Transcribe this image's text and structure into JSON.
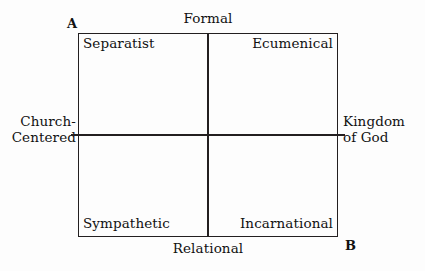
{
  "diagram": {
    "type": "two-by-two-quadrant-matrix",
    "title": "",
    "axes": {
      "horizontal": {
        "left_label": "Church-\nCentered",
        "left_label_lines": [
          "Church-",
          "Centered"
        ],
        "right_label": "Kingdom\nof God",
        "right_label_lines": [
          "Kingdom",
          "of God"
        ]
      },
      "vertical": {
        "top_label": "Formal",
        "bottom_label": "Relational"
      }
    },
    "corner_markers": [
      {
        "id": "marker-a",
        "label": "A",
        "position": "top-left"
      },
      {
        "id": "marker-b",
        "label": "B",
        "position": "bottom-right"
      }
    ],
    "quadrants": [
      {
        "id": "top-left",
        "label": "Separatist",
        "horizontal_axis_value": "Church-Centered",
        "vertical_axis_value": "Formal"
      },
      {
        "id": "top-right",
        "label": "Ecumenical",
        "horizontal_axis_value": "Kingdom of God",
        "vertical_axis_value": "Formal"
      },
      {
        "id": "bottom-left",
        "label": "Sympathetic",
        "horizontal_axis_value": "Church-Centered",
        "vertical_axis_value": "Relational"
      },
      {
        "id": "bottom-right",
        "label": "Incarnational",
        "horizontal_axis_value": "Kingdom of God",
        "vertical_axis_value": "Relational"
      }
    ],
    "colors": {
      "background": "#fdfdfd",
      "line": "#231f20",
      "text": "#111111"
    }
  }
}
